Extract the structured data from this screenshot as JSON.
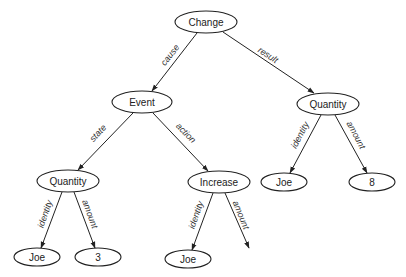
{
  "diagram": {
    "type": "semantic-network",
    "nodes": [
      {
        "id": "change",
        "label": "Change",
        "cx": 206,
        "cy": 22,
        "rx": 31,
        "ry": 11
      },
      {
        "id": "event",
        "label": "Event",
        "cx": 142,
        "cy": 102,
        "rx": 30,
        "ry": 11
      },
      {
        "id": "quantity_r",
        "label": "Quantity",
        "cx": 328,
        "cy": 104,
        "rx": 31,
        "ry": 11
      },
      {
        "id": "quantity_l",
        "label": "Quantity",
        "cx": 68,
        "cy": 181,
        "rx": 31,
        "ry": 11
      },
      {
        "id": "increase",
        "label": "Increase",
        "cx": 219,
        "cy": 182,
        "rx": 31,
        "ry": 11
      },
      {
        "id": "joe_r",
        "label": "Joe",
        "cx": 284,
        "cy": 182,
        "rx": 23,
        "ry": 9
      },
      {
        "id": "eight",
        "label": "8",
        "cx": 372,
        "cy": 182,
        "rx": 23,
        "ry": 9
      },
      {
        "id": "joe_ll",
        "label": "Joe",
        "cx": 37,
        "cy": 257,
        "rx": 23,
        "ry": 9
      },
      {
        "id": "three",
        "label": "3",
        "cx": 98,
        "cy": 257,
        "rx": 23,
        "ry": 9
      },
      {
        "id": "joe_inc",
        "label": "Joe",
        "cx": 188,
        "cy": 259,
        "rx": 23,
        "ry": 9
      }
    ],
    "edges": [
      {
        "from": "change",
        "to": "event",
        "label": "cause",
        "x1": 197,
        "y1": 33,
        "x2": 152,
        "y2": 91,
        "lx": 170,
        "ly": 55,
        "angle": -52
      },
      {
        "from": "change",
        "to": "quantity_r",
        "label": "result",
        "x1": 223,
        "y1": 32,
        "x2": 314,
        "y2": 93,
        "lx": 268,
        "ly": 55,
        "angle": 33
      },
      {
        "from": "event",
        "to": "quantity_l",
        "label": "state",
        "x1": 133,
        "y1": 113,
        "x2": 78,
        "y2": 170,
        "lx": 98,
        "ly": 133,
        "angle": -47
      },
      {
        "from": "event",
        "to": "increase",
        "label": "action",
        "x1": 153,
        "y1": 113,
        "x2": 208,
        "y2": 171,
        "lx": 186,
        "ly": 133,
        "angle": 45
      },
      {
        "from": "quantity_r",
        "to": "joe_r",
        "label": "identity",
        "x1": 321,
        "y1": 115,
        "x2": 290,
        "y2": 173,
        "lx": 300,
        "ly": 135,
        "angle": -62
      },
      {
        "from": "quantity_r",
        "to": "eight",
        "label": "amount",
        "x1": 335,
        "y1": 115,
        "x2": 367,
        "y2": 173,
        "lx": 356,
        "ly": 135,
        "angle": 62
      },
      {
        "from": "quantity_l",
        "to": "joe_ll",
        "label": "identity",
        "x1": 62,
        "y1": 192,
        "x2": 41,
        "y2": 248,
        "lx": 45,
        "ly": 214,
        "angle": -71
      },
      {
        "from": "quantity_l",
        "to": "three",
        "label": "amount",
        "x1": 74,
        "y1": 192,
        "x2": 95,
        "y2": 248,
        "lx": 90,
        "ly": 214,
        "angle": 70
      },
      {
        "from": "increase",
        "to": "joe_inc",
        "label": "identity",
        "x1": 213,
        "y1": 193,
        "x2": 192,
        "y2": 250,
        "lx": 196,
        "ly": 215,
        "angle": -71
      },
      {
        "from": "increase",
        "to": "(none)",
        "label": "amount",
        "x1": 225,
        "y1": 193,
        "x2": 249,
        "y2": 248,
        "lx": 241,
        "ly": 215,
        "angle": 68
      }
    ]
  }
}
